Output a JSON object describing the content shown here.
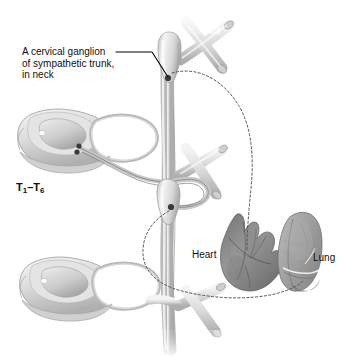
{
  "figure": {
    "background_color": "#ffffff",
    "labels": {
      "ganglion_line1": "A cervical ganglion",
      "ganglion_line2": "of sympathetic trunk,",
      "ganglion_line3": "in neck",
      "spinal_segments_prefix": "T",
      "spinal_segments_sub1": "1",
      "spinal_segments_dash": "–",
      "spinal_segments_sub2": "6",
      "heart": "Heart",
      "lung": "Lung"
    },
    "colors": {
      "nerve_light": "#e8e8e8",
      "nerve_mid": "#c9c9c9",
      "nerve_shadow": "#a8a8a8",
      "bone_light": "#ededed",
      "bone_mid": "#cfcfcf",
      "ganglion_dot": "#3a3a3a",
      "dashed_path": "#555555",
      "leader_line": "#000000",
      "heart_dark": "#6b6b6b",
      "heart_mid": "#8d8d8d",
      "lung_mid": "#a5a5a5",
      "lung_light": "#c2c2c2",
      "text": "#111111"
    },
    "structures": {
      "sympathetic_trunk": "vertical nerve cord",
      "cervical_ganglion": "upper swollen ganglion with marker dot",
      "thoracic_ganglion": "lower swollen ganglion with marker dot",
      "spinal_cord_upper": "vertebra and spinal cord cross-section, upper left",
      "spinal_cord_lower": "vertebra and spinal cord cross-section, lower left",
      "heart_organ": "heart with great vessels",
      "lung_organ": "right lung, lateral view",
      "dashed_pathway_heart": "postganglionic fiber from cervical ganglion to heart",
      "dashed_pathway_lung": "postganglionic fiber from thoracic ganglion to lung"
    }
  }
}
